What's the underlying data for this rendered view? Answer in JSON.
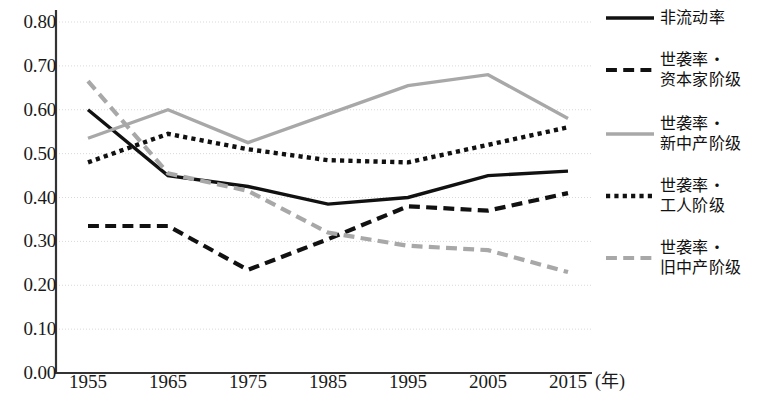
{
  "chart_data": {
    "type": "line",
    "title": "",
    "xlabel": "(年)",
    "ylabel": "",
    "categories": [
      "1955",
      "1965",
      "1975",
      "1985",
      "1995",
      "2005",
      "2015"
    ],
    "x": [
      1955,
      1965,
      1975,
      1985,
      1995,
      2005,
      2015
    ],
    "xlim": [
      1950,
      2020
    ],
    "ylim": [
      0.0,
      0.8
    ],
    "ytick_labels": [
      "0.00",
      "0.10",
      "0.20",
      "0.30",
      "0.40",
      "0.50",
      "0.60",
      "0.70",
      "0.80"
    ],
    "ytick_values": [
      0.0,
      0.1,
      0.2,
      0.3,
      0.4,
      0.5,
      0.6,
      0.7,
      0.8
    ],
    "grid": true,
    "grid_style": "dotted-horizontal",
    "legend_position": "right",
    "series": [
      {
        "name": "非流动率",
        "style": "solid",
        "color": "#111111",
        "width": 3.4,
        "values": [
          0.6,
          0.45,
          0.425,
          0.385,
          0.4,
          0.45,
          0.46
        ]
      },
      {
        "name": "世袭率・\n资本家阶级",
        "style": "dashed",
        "color": "#111111",
        "width": 4.2,
        "values": [
          0.335,
          0.335,
          0.235,
          0.305,
          0.38,
          0.37,
          0.41
        ]
      },
      {
        "name": "世袭率・\n新中产阶级",
        "style": "solid",
        "color": "#a8a8a8",
        "width": 3.4,
        "values": [
          0.535,
          0.6,
          0.525,
          0.59,
          0.655,
          0.68,
          0.58
        ]
      },
      {
        "name": "世袭率・\n工人阶级",
        "style": "dotted",
        "color": "#111111",
        "width": 4.4,
        "values": [
          0.48,
          0.545,
          0.51,
          0.485,
          0.48,
          0.52,
          0.56
        ]
      },
      {
        "name": "世袭率・\n旧中产阶级",
        "style": "dashed",
        "color": "#a8a8a8",
        "width": 4.2,
        "values": [
          0.665,
          0.455,
          0.415,
          0.32,
          0.29,
          0.28,
          0.23
        ]
      }
    ]
  },
  "axes": {
    "spine_color": "#333333",
    "gridline_color": "#d9d9d9"
  },
  "legend": {
    "items": [
      {
        "label": "非流动率"
      },
      {
        "label": "世袭率・\n资本家阶级"
      },
      {
        "label": "世袭率・\n新中产阶级"
      },
      {
        "label": "世袭率・\n工人阶级"
      },
      {
        "label": "世袭率・\n旧中产阶级"
      }
    ]
  }
}
